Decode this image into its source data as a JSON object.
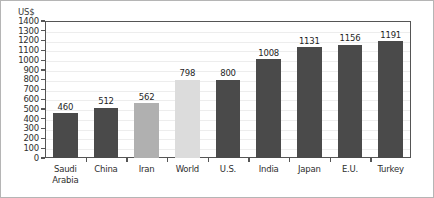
{
  "chart_data": {
    "type": "bar",
    "title": "",
    "subtitle": "",
    "xlabel": "",
    "ylabel": "US$",
    "ylim": [
      0,
      1400
    ],
    "ytick_step": 100,
    "yticks": [
      1400,
      1300,
      1200,
      1100,
      1000,
      900,
      800,
      700,
      600,
      500,
      400,
      300,
      200,
      100,
      0
    ],
    "ytick_labels": [
      "1400",
      "1300",
      "1200",
      "1100",
      "1000",
      "900",
      "800",
      "700",
      "600",
      "500",
      "400",
      "300",
      "200",
      "100",
      "0"
    ],
    "grid": true,
    "grid_axis": "y",
    "legend": false,
    "categories": [
      "Saudi Arabia",
      "China",
      "Iran",
      "World",
      "U.S.",
      "India",
      "Japan",
      "E.U.",
      "Turkey"
    ],
    "values": [
      460,
      512,
      562,
      798,
      800,
      1008,
      1131,
      1156,
      1191
    ],
    "value_labels": [
      "460",
      "512",
      "562",
      "798",
      "800",
      "1008",
      "1131",
      "1156",
      "1191"
    ],
    "bars": [
      {
        "category": "Saudi Arabia",
        "label_lines": [
          "Saudi",
          "Arabia"
        ],
        "value": 460,
        "value_label": "460",
        "color": "#4a4a4a",
        "color_name": "dark-gray"
      },
      {
        "category": "China",
        "label_lines": [
          "China"
        ],
        "value": 512,
        "value_label": "512",
        "color": "#4a4a4a",
        "color_name": "dark-gray"
      },
      {
        "category": "Iran",
        "label_lines": [
          "Iran"
        ],
        "value": 562,
        "value_label": "562",
        "color": "#b0b0b0",
        "color_name": "medium-gray"
      },
      {
        "category": "World",
        "label_lines": [
          "World"
        ],
        "value": 798,
        "value_label": "798",
        "color": "#dcdcdc",
        "color_name": "light-gray"
      },
      {
        "category": "U.S.",
        "label_lines": [
          "U.S."
        ],
        "value": 800,
        "value_label": "800",
        "color": "#4a4a4a",
        "color_name": "dark-gray"
      },
      {
        "category": "India",
        "label_lines": [
          "India"
        ],
        "value": 1008,
        "value_label": "1008",
        "color": "#4a4a4a",
        "color_name": "dark-gray"
      },
      {
        "category": "Japan",
        "label_lines": [
          "Japan"
        ],
        "value": 1131,
        "value_label": "1131",
        "color": "#4a4a4a",
        "color_name": "dark-gray"
      },
      {
        "category": "E.U.",
        "label_lines": [
          "E.U."
        ],
        "value": 1156,
        "value_label": "1156",
        "color": "#4a4a4a",
        "color_name": "dark-gray"
      },
      {
        "category": "Turkey",
        "label_lines": [
          "Turkey"
        ],
        "value": 1191,
        "value_label": "1191",
        "color": "#4a4a4a",
        "color_name": "dark-gray"
      }
    ],
    "colors": {
      "dark_gray": "#4a4a4a",
      "medium_gray": "#b0b0b0",
      "light_gray": "#dcdcdc",
      "axis": "#555555",
      "gridline": "#ededed",
      "frame_border": "#b5b5b5",
      "text": "#2e2e2e"
    }
  }
}
